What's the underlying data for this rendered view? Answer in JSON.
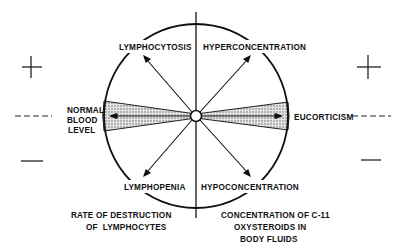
{
  "diagram": {
    "left_axis_signs": {
      "plus": "+",
      "normal": "----",
      "minus": "—"
    },
    "right_axis_signs": {
      "plus": "+",
      "normal": "----",
      "minus": "—"
    },
    "quadrant_labels": {
      "upper_left": "LYMPHOCYTOSIS",
      "upper_right": "HYPERCONCENTRATION",
      "lower_left": "LYMPHOPENIA",
      "lower_right": "HYPOCONCENTRATION"
    },
    "left_side_label": [
      "NORMAL",
      "BLOOD",
      "LEVEL"
    ],
    "right_side_label": "EUCORTICISM",
    "bottom_left_caption": [
      "RATE OF DESTRUCTION",
      "OF  LYMPHOCYTES"
    ],
    "bottom_right_caption": [
      "CONCENTRATION OF C-11",
      "OXYSTEROIDS IN",
      "BODY FLUIDS"
    ]
  }
}
